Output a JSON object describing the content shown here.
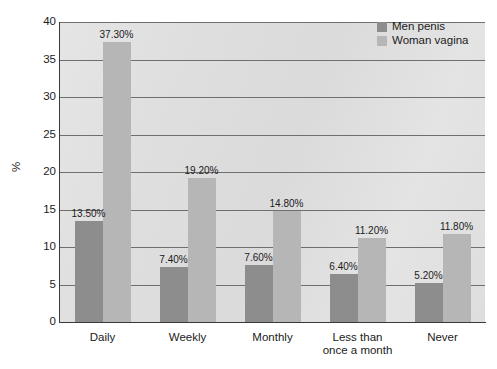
{
  "chart_data": {
    "type": "bar",
    "title": "",
    "xlabel": "",
    "ylabel": "%",
    "ylim": [
      0,
      40
    ],
    "ytick_step": 5,
    "yticks": [
      "0",
      "5",
      "10",
      "15",
      "20",
      "25",
      "30",
      "35",
      "40"
    ],
    "grid": true,
    "grid_axis": "y",
    "legend_position": "top-right",
    "categories": [
      "Daily",
      "Weekly",
      "Monthly",
      "Less than\nonce a month",
      "Never"
    ],
    "series": [
      {
        "name": "Men penis",
        "color": "#8d8d8d",
        "values": [
          13.5,
          7.4,
          7.6,
          6.4,
          5.2
        ],
        "labels": [
          "13.50%",
          "7.40%",
          "7.60%",
          "6.40%",
          "5.20%"
        ]
      },
      {
        "name": "Woman vagina",
        "color": "#b6b6b6",
        "values": [
          37.3,
          19.2,
          14.8,
          11.2,
          11.8
        ],
        "labels": [
          "37.30%",
          "19.20%",
          "14.80%",
          "11.20%",
          "11.80%"
        ]
      }
    ]
  },
  "legend": {
    "items": [
      {
        "label": "Men penis",
        "color": "#8d8d8d"
      },
      {
        "label": "Woman vagina",
        "color": "#b6b6b6"
      }
    ]
  },
  "axes": {
    "y_title": "%",
    "y_tick_labels": [
      "40",
      "35",
      "30",
      "25",
      "20",
      "15",
      "10",
      "5",
      "0"
    ],
    "x_tick_labels": [
      "Daily",
      "Weekly",
      "Monthly",
      "Less than\nonce a month",
      "Never"
    ]
  },
  "colors": {
    "plot_background": "#dedede",
    "gridline": "#6f6f6f",
    "axis": "#3a3a3a",
    "text": "#1b1b1b",
    "page_background": "#ffffff"
  }
}
